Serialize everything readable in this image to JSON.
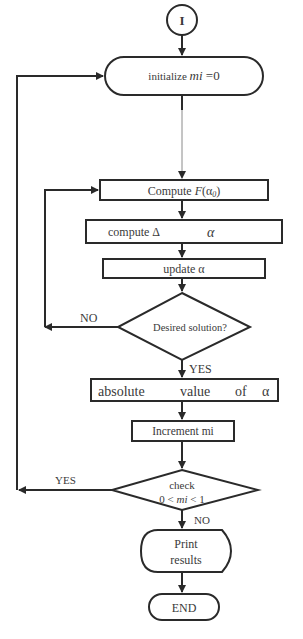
{
  "flowchart": {
    "start": {
      "label": "I"
    },
    "initialize": {
      "label": "initialize ",
      "var": "mi",
      "suffix": " =0"
    },
    "compute_f": {
      "label": "Compute ",
      "func": "F",
      "arg": "(α",
      "sub": "0",
      "close": ")"
    },
    "compute_delta": {
      "label": "compute Δ",
      "var": "α"
    },
    "update": {
      "label": "update α"
    },
    "decision_solution": {
      "label": "Desired solution?",
      "no_label": "NO",
      "yes_label": "YES"
    },
    "absolute": {
      "words": [
        "absolute",
        "value",
        "of",
        "α"
      ]
    },
    "increment": {
      "label": "Increment mi"
    },
    "decision_check": {
      "line1": "check",
      "line2_pre": "0 < ",
      "line2_var": "mi",
      "line2_post": " < 1",
      "yes_label": "YES",
      "no_label": "NO"
    },
    "print": {
      "line1": "Print",
      "line2": "results"
    },
    "end": {
      "label": "END"
    }
  },
  "colors": {
    "stroke": "#2a2a2a",
    "text": "#3a3a3a",
    "background": "#ffffff"
  }
}
